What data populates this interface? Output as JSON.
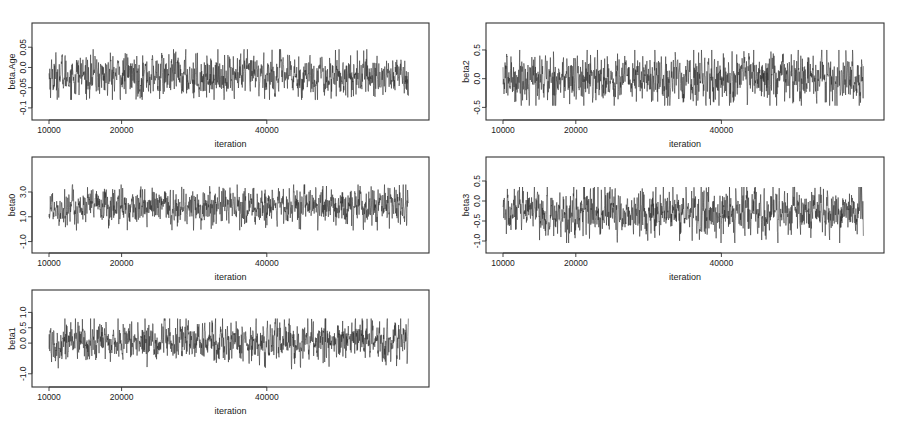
{
  "chart_data": [
    {
      "type": "line",
      "id": "beta_age",
      "title": "",
      "xlabel": "iteration",
      "ylabel": "beta.Age",
      "x_ticks": [
        10000,
        20000,
        40000
      ],
      "x_tick_labels": [
        "10000",
        "20000",
        "40000"
      ],
      "xlim": [
        10000,
        60000
      ],
      "y_ticks": [
        -0.1,
        -0.05,
        0.0,
        0.05
      ],
      "y_tick_labels": [
        "-0.1",
        "-0.05",
        "0.0",
        "0.05"
      ],
      "ylim": [
        -0.12,
        0.1
      ],
      "series_summary": {
        "center": -0.02,
        "typical_min": -0.06,
        "typical_max": 0.02,
        "extreme_min": -0.08,
        "extreme_max": 0.045
      },
      "grid": false,
      "legend": null
    },
    {
      "type": "line",
      "id": "beta2",
      "title": "",
      "xlabel": "iteration",
      "ylabel": "beta2",
      "x_ticks": [
        10000,
        20000,
        40000
      ],
      "x_tick_labels": [
        "10000",
        "20000",
        "40000"
      ],
      "xlim": [
        10000,
        60000
      ],
      "y_ticks": [
        -0.5,
        0.0,
        0.5
      ],
      "y_tick_labels": [
        "-0.5",
        "0.0",
        "0.5"
      ],
      "ylim": [
        -0.65,
        0.9
      ],
      "series_summary": {
        "center": 0.0,
        "typical_min": -0.3,
        "typical_max": 0.35,
        "extreme_min": -0.47,
        "extreme_max": 0.5
      },
      "grid": false,
      "legend": null
    },
    {
      "type": "line",
      "id": "beta0",
      "title": "",
      "xlabel": "iteration",
      "ylabel": "beta0",
      "x_ticks": [
        10000,
        20000,
        40000
      ],
      "x_tick_labels": [
        "10000",
        "20000",
        "40000"
      ],
      "xlim": [
        10000,
        60000
      ],
      "y_ticks": [
        -1.0,
        1.0,
        3.0
      ],
      "y_tick_labels": [
        "-1.0",
        "1.0",
        "3.0"
      ],
      "ylim": [
        -1.6,
        5.5
      ],
      "series_summary": {
        "center": 1.8,
        "typical_min": 0.6,
        "typical_max": 2.9,
        "extreme_min": -0.1,
        "extreme_max": 3.6
      },
      "grid": false,
      "legend": null
    },
    {
      "type": "line",
      "id": "beta3",
      "title": "",
      "xlabel": "iteration",
      "ylabel": "beta3",
      "x_ticks": [
        10000,
        20000,
        40000
      ],
      "x_tick_labels": [
        "10000",
        "20000",
        "40000"
      ],
      "xlim": [
        10000,
        60000
      ],
      "y_ticks": [
        -1.0,
        -0.5,
        0.0,
        0.5
      ],
      "y_tick_labels": [
        "-1.0",
        "-0.5",
        "0.0",
        "0.5"
      ],
      "ylim": [
        -1.2,
        1.0
      ],
      "series_summary": {
        "center": -0.3,
        "typical_min": -0.75,
        "typical_max": 0.15,
        "extreme_min": -1.05,
        "extreme_max": 0.35
      },
      "grid": false,
      "legend": null
    },
    {
      "type": "line",
      "id": "beta1",
      "title": "",
      "xlabel": "iteration",
      "ylabel": "beta1",
      "x_ticks": [
        10000,
        20000,
        40000
      ],
      "x_tick_labels": [
        "10000",
        "20000",
        "40000"
      ],
      "xlim": [
        10000,
        60000
      ],
      "y_ticks": [
        -1.0,
        0.0,
        0.5,
        1.0
      ],
      "y_tick_labels": [
        "-1.0",
        "0.0",
        "0.5",
        "1.0"
      ],
      "ylim": [
        -1.3,
        1.6
      ],
      "series_summary": {
        "center": 0.05,
        "typical_min": -0.45,
        "typical_max": 0.55,
        "extreme_min": -0.85,
        "extreme_max": 0.8
      },
      "grid": false,
      "legend": null
    }
  ],
  "panels": [
    {
      "id": "beta_age",
      "ylabel": "beta.Age",
      "xlabel": "iteration",
      "x_tick_labels": [
        "10000",
        "20000",
        "40000"
      ],
      "y_tick_labels": [
        "-0.1",
        "-0.05",
        "0.0",
        "0.05"
      ]
    },
    {
      "id": "beta2",
      "ylabel": "beta2",
      "xlabel": "iteration",
      "x_tick_labels": [
        "10000",
        "20000",
        "40000"
      ],
      "y_tick_labels": [
        "-0.5",
        "0.0",
        "0.5"
      ]
    },
    {
      "id": "beta0",
      "ylabel": "beta0",
      "xlabel": "iteration",
      "x_tick_labels": [
        "10000",
        "20000",
        "40000"
      ],
      "y_tick_labels": [
        "-1.0",
        "1.0",
        "3.0"
      ]
    },
    {
      "id": "beta3",
      "ylabel": "beta3",
      "xlabel": "iteration",
      "x_tick_labels": [
        "10000",
        "20000",
        "40000"
      ],
      "y_tick_labels": [
        "-1.0",
        "-0.5",
        "0.0",
        "0.5"
      ]
    },
    {
      "id": "beta1",
      "ylabel": "beta1",
      "xlabel": "iteration",
      "x_tick_labels": [
        "10000",
        "20000",
        "40000"
      ],
      "y_tick_labels": [
        "-1.0",
        "0.0",
        "0.5",
        "1.0"
      ]
    }
  ],
  "colors": {
    "trace": "#2b2b2b",
    "axis": "#333333",
    "background": "#ffffff"
  }
}
